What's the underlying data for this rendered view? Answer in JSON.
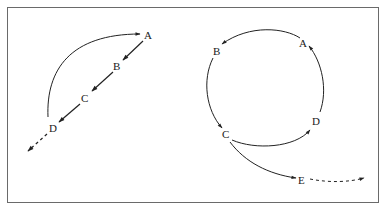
{
  "figure": {
    "colors": {
      "line": "#222222",
      "border": "#6a6a6a",
      "background": "#ffffff"
    },
    "left_diagram": {
      "description": "Linear sequence A-B-C-D with return arc from D to A and dashed continuation beyond D",
      "nodes": [
        {
          "id": "A",
          "label": "A"
        },
        {
          "id": "B",
          "label": "B"
        },
        {
          "id": "C",
          "label": "C"
        },
        {
          "id": "D",
          "label": "D"
        }
      ],
      "edges": [
        {
          "from": "A",
          "to": "B",
          "style": "solid"
        },
        {
          "from": "B",
          "to": "C",
          "style": "solid"
        },
        {
          "from": "C",
          "to": "D",
          "style": "solid"
        },
        {
          "from": "D",
          "to": "A",
          "style": "solid-curved"
        },
        {
          "from": "D",
          "to": "beyond",
          "style": "dashed"
        }
      ]
    },
    "right_diagram": {
      "description": "Circular cycle A-B-C-D with branch from C to E and dashed continuation beyond E",
      "nodes": [
        {
          "id": "A",
          "label": "A"
        },
        {
          "id": "B",
          "label": "B"
        },
        {
          "id": "C",
          "label": "C"
        },
        {
          "id": "D",
          "label": "D"
        },
        {
          "id": "E",
          "label": "E"
        }
      ],
      "edges": [
        {
          "from": "A",
          "to": "B",
          "style": "solid-curved"
        },
        {
          "from": "B",
          "to": "C",
          "style": "solid-curved"
        },
        {
          "from": "C",
          "to": "D",
          "style": "solid-curved"
        },
        {
          "from": "D",
          "to": "A",
          "style": "solid-curved"
        },
        {
          "from": "C",
          "to": "E",
          "style": "solid-curved"
        },
        {
          "from": "E",
          "to": "beyond",
          "style": "dashed"
        }
      ]
    }
  }
}
